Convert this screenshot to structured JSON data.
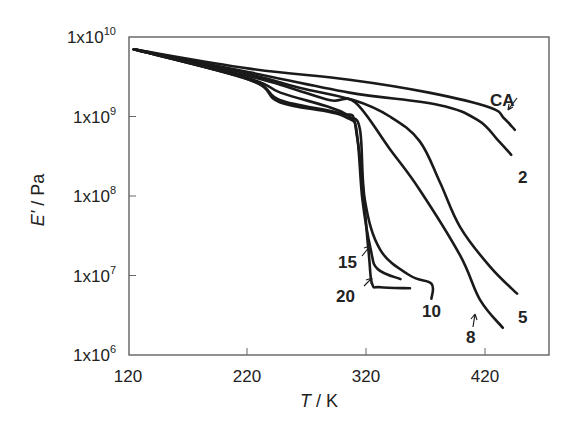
{
  "chart_data": {
    "type": "line",
    "title": "",
    "xlabel": "T / K",
    "ylabel": "E' / Pa",
    "xlim": [
      120,
      470
    ],
    "ylim_log10": [
      6,
      10
    ],
    "yscale": "log",
    "grid": false,
    "legend": "inline labels",
    "x_ticks": [
      "120",
      "220",
      "320",
      "420"
    ],
    "x_tick_values": [
      120,
      220,
      320,
      420
    ],
    "y_ticks": [
      {
        "base": "1x10",
        "exp": "10",
        "value": 10000000000.0
      },
      {
        "base": "1x10",
        "exp": "9",
        "value": 1000000000.0
      },
      {
        "base": "1x10",
        "exp": "8",
        "value": 100000000.0
      },
      {
        "base": "1x10",
        "exp": "7",
        "value": 10000000.0
      },
      {
        "base": "1x10",
        "exp": "6",
        "value": 1000000.0
      }
    ],
    "series": [
      {
        "name": "CA",
        "label": "CA",
        "points": [
          [
            125,
            7000000000.0
          ],
          [
            222,
            4000000000.0
          ],
          [
            306,
            2900000000.0
          ],
          [
            373,
            2000000000.0
          ],
          [
            424,
            1300000000.0
          ],
          [
            436,
            950000000.0
          ],
          [
            445,
            680000000.0
          ]
        ]
      },
      {
        "name": "2",
        "label": "2",
        "points": [
          [
            125,
            7000000000.0
          ],
          [
            222,
            3600000000.0
          ],
          [
            306,
            2000000000.0
          ],
          [
            381,
            1400000000.0
          ],
          [
            414,
            900000000.0
          ],
          [
            431,
            500000000.0
          ],
          [
            442,
            330000000.0
          ]
        ]
      },
      {
        "name": "5",
        "label": "5",
        "points": [
          [
            125,
            7000000000.0
          ],
          [
            222,
            3400000000.0
          ],
          [
            264,
            2300000000.0
          ],
          [
            310,
            1600000000.0
          ],
          [
            340,
            1000000000.0
          ],
          [
            365,
            490000000.0
          ],
          [
            382,
            150000000.0
          ],
          [
            399,
            41000000.0
          ],
          [
            424,
            13000000.0
          ],
          [
            447,
            5900000.0
          ]
        ]
      },
      {
        "name": "8",
        "label": "8",
        "points": [
          [
            125,
            7000000000.0
          ],
          [
            222,
            3200000000.0
          ],
          [
            256,
            2300000000.0
          ],
          [
            290,
            1600000000.0
          ],
          [
            311,
            1500000000.0
          ],
          [
            340,
            390000000.0
          ],
          [
            365,
            120000000.0
          ],
          [
            399,
            18000000.0
          ],
          [
            416,
            4900000.0
          ],
          [
            435,
            2200000.0
          ]
        ]
      },
      {
        "name": "10",
        "label": "10",
        "points": [
          [
            125,
            7000000000.0
          ],
          [
            222,
            3000000000.0
          ],
          [
            248,
            2000000000.0
          ],
          [
            290,
            1300000000.0
          ],
          [
            306,
            1000000000.0
          ],
          [
            315,
            680000000.0
          ],
          [
            319,
            90000000.0
          ],
          [
            332,
            21000000.0
          ],
          [
            357,
            10000000.0
          ],
          [
            375,
            7900000.0
          ],
          [
            375,
            5100000.0
          ]
        ]
      },
      {
        "name": "15",
        "label": "15",
        "points": [
          [
            125,
            7000000000.0
          ],
          [
            222,
            2900000000.0
          ],
          [
            248,
            1600000000.0
          ],
          [
            298,
            1100000000.0
          ],
          [
            311,
            800000000.0
          ],
          [
            317,
            90000000.0
          ],
          [
            324,
            21000000.0
          ],
          [
            330,
            12000000.0
          ],
          [
            349,
            9000000.0
          ]
        ]
      },
      {
        "name": "20",
        "label": "20",
        "points": [
          [
            125,
            7000000000.0
          ],
          [
            222,
            2900000000.0
          ],
          [
            248,
            1500000000.0
          ],
          [
            302,
            1000000000.0
          ],
          [
            313,
            490000000.0
          ],
          [
            322,
            21000000.0
          ],
          [
            325,
            8000000.0
          ],
          [
            332,
            7100000.0
          ],
          [
            357,
            6900000.0
          ]
        ]
      }
    ]
  },
  "labels": {
    "x_axis_title_italic": "T",
    "x_axis_title_rest": " / K",
    "y_axis_title_italic": "E'",
    "y_axis_title_rest": " / Pa",
    "curve_CA": "CA",
    "curve_2": "2",
    "curve_5": "5",
    "curve_8": "8",
    "curve_10": "10",
    "curve_15": "15",
    "curve_20": "20"
  }
}
